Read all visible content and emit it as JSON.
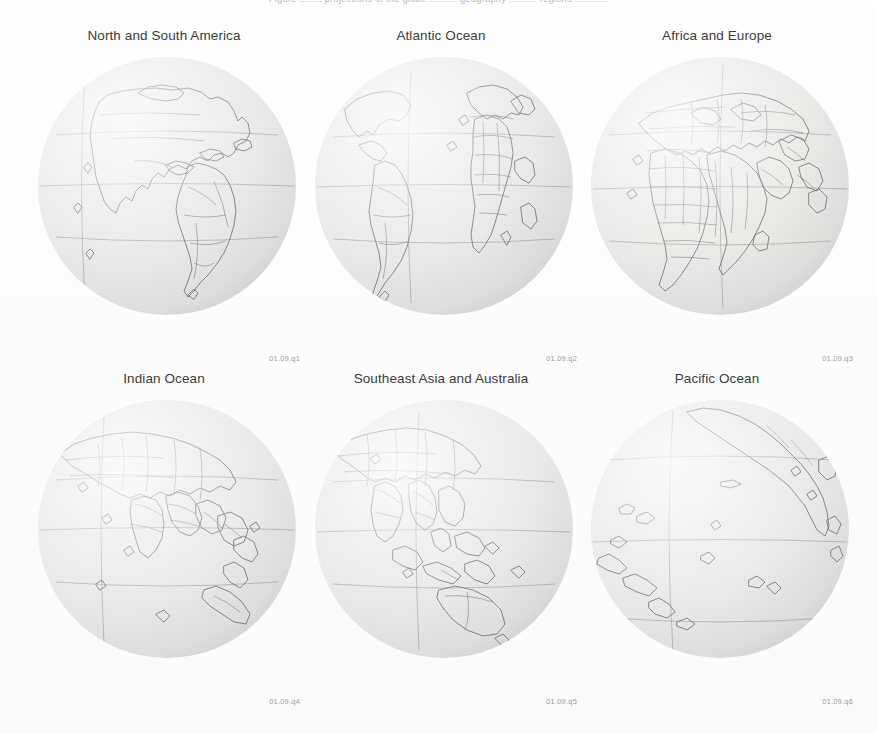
{
  "page": {
    "background_color": "#fdfdfd",
    "running_head": "Figure ........ projections of the globe .......... geography .......... regions ............"
  },
  "globe_style": {
    "sphere_fill": "#e9e9e7",
    "coastline_color": "#6f6f72",
    "border_color": "#76767a",
    "graticule_color": "#8e8e92",
    "label_color": "#9c9ca0",
    "caption_color": "#3c3c3c"
  },
  "figures": [
    {
      "caption": "North and South America",
      "id_label": "01.09.q1",
      "center_lon": -85,
      "center_lat": 12,
      "row": 0,
      "column": 0
    },
    {
      "caption": "Atlantic Ocean",
      "id_label": "01.09.q2",
      "center_lon": -35,
      "center_lat": 10,
      "row": 0,
      "column": 1
    },
    {
      "caption": "Africa and Europe",
      "id_label": "01.09.q3",
      "center_lon": 20,
      "center_lat": 12,
      "row": 0,
      "column": 2
    },
    {
      "caption": "Indian Ocean",
      "id_label": "01.09.q4",
      "center_lon": 75,
      "center_lat": 10,
      "row": 1,
      "column": 0
    },
    {
      "caption": "Southeast Asia and Australia",
      "id_label": "01.09.q5",
      "center_lon": 120,
      "center_lat": 8,
      "row": 1,
      "column": 1
    },
    {
      "caption": "Pacific Ocean",
      "id_label": "01.09.q6",
      "center_lon": 180,
      "center_lat": 8,
      "row": 1,
      "column": 2
    }
  ],
  "graticule": {
    "latitude_lines": [
      {
        "name": "Tropic of Cancer",
        "value": 23.5
      },
      {
        "name": "Equator",
        "value": 0
      },
      {
        "name": "Tropic of Capricorn",
        "value": -23.5
      }
    ],
    "meridian_interval_deg": 180
  }
}
